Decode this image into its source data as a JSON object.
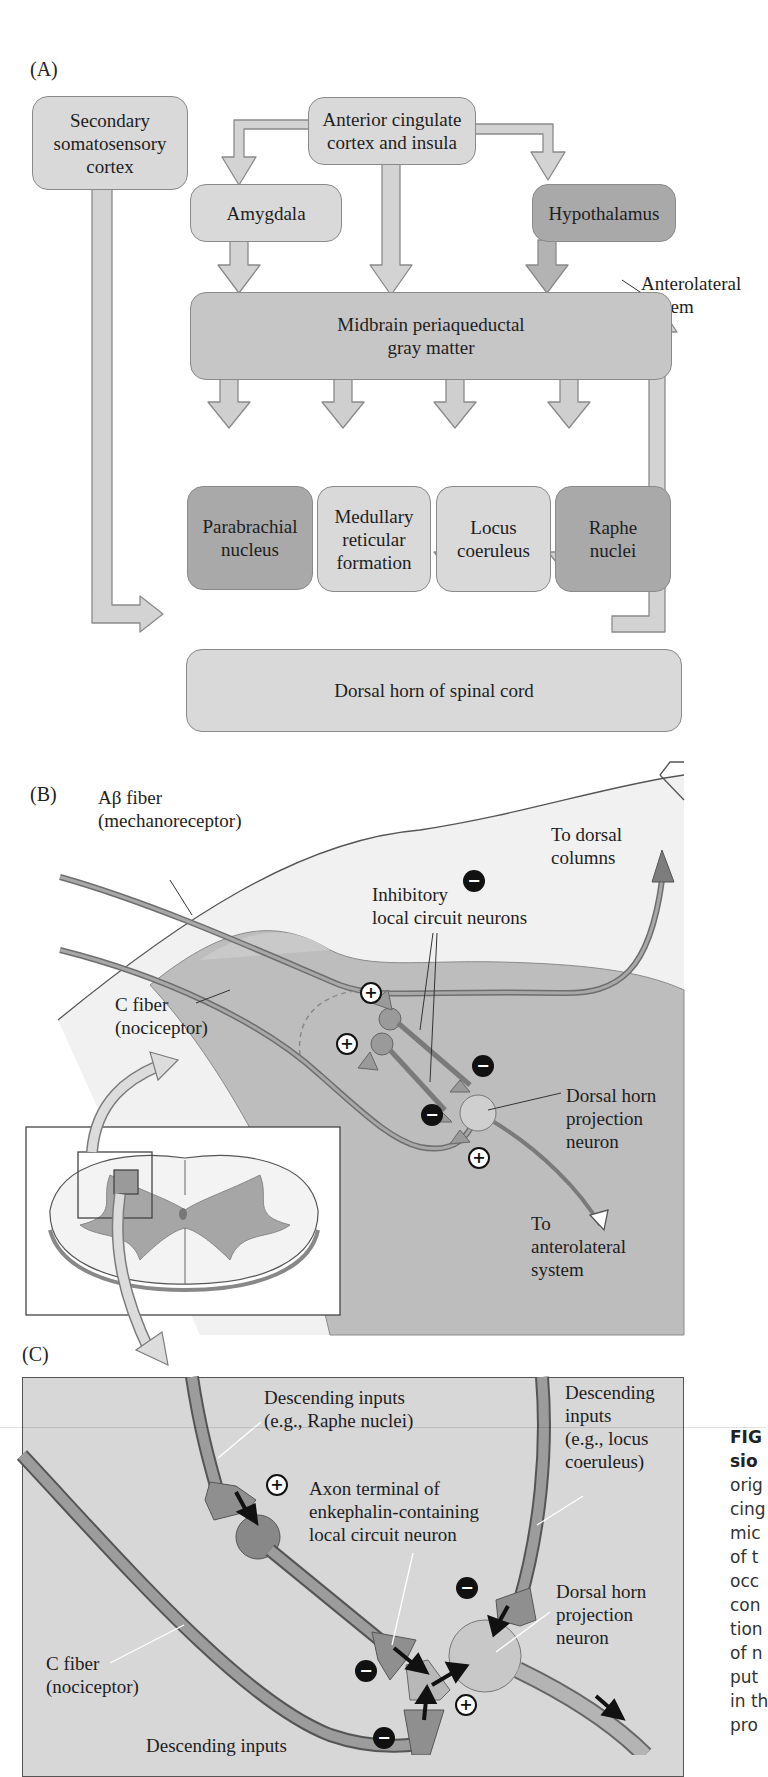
{
  "panels": {
    "a": {
      "label": "(A)",
      "boxes": {
        "secondary_somatosensory": "Secondary\nsomatosensory\ncortex",
        "anterior_cingulate": "Anterior cingulate\ncortex and insula",
        "amygdala": "Amygdala",
        "hypothalamus": "Hypothalamus",
        "pag": "Midbrain periaqueductal\ngray matter",
        "parabrachial": "Parabrachial\nnucleus",
        "medullary": "Medullary\nreticular\nformation",
        "locus": "Locus\ncoeruleus",
        "raphe": "Raphe\nnuclei",
        "dorsal_horn": "Dorsal horn of spinal cord"
      },
      "anterolateral_label": "Anterolateral\nsystem"
    },
    "b": {
      "label": "(B)",
      "abeta_fiber": "Aβ fiber\n(mechanoreceptor)",
      "c_fiber": "C fiber\n(nociceptor)",
      "inhibitory": "Inhibitory\nlocal circuit neurons",
      "to_dorsal_columns": "To dorsal\ncolumns",
      "projection_neuron": "Dorsal horn\nprojection\nneuron",
      "to_anterolateral": "To\nanterolateral\nsystem",
      "signs": {
        "plus": "+",
        "minus": "−"
      }
    },
    "c": {
      "label": "(C)",
      "descending_raphe": "Descending inputs\n(e.g., Raphe nuclei)",
      "descending_locus": "Descending\ninputs\n(e.g., locus\ncoeruleus)",
      "axon_terminal": "Axon terminal of\nenkephalin-containing\nlocal circuit neuron",
      "projection_neuron": "Dorsal horn\nprojection\nneuron",
      "c_fiber": "C fiber\n(nociceptor)",
      "descending_bottom": "Descending inputs"
    }
  },
  "caption_fragments": [
    "FIG",
    "sio",
    "orig",
    "cing",
    "mic",
    "of t",
    "occ",
    "con",
    "tion",
    "of n",
    "put",
    "in th",
    "pro"
  ],
  "colors": {
    "light_box": "#d9d9d9",
    "mid_box": "#c6c6c6",
    "dark_box": "#a9a9a9",
    "tissue_light": "#efefef",
    "tissue_gray": "#bdbdbd",
    "fiber": "#8f8f8f"
  }
}
